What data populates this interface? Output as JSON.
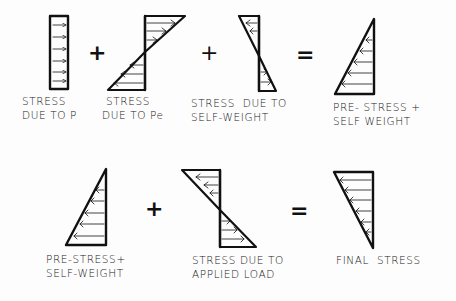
{
  "row1": {
    "items": [
      {
        "id": "p",
        "label_line1": "STRESS",
        "label_line2": "DUE TO P"
      },
      {
        "id": "pe",
        "label_line1": "STRESS",
        "label_line2": "DUE TO Pe"
      },
      {
        "id": "sw",
        "label_line1": "STRESS  DUE TO",
        "label_line2": "SELF-WEIGHT"
      },
      {
        "id": "ps_sw",
        "label_line1": "PRE- STRESS +",
        "label_line2": "SELF WEIGHT"
      }
    ],
    "operators": [
      "+",
      "+",
      "="
    ]
  },
  "row2": {
    "items": [
      {
        "id": "ps_sw2",
        "label_line1": "PRE-STRESS+",
        "label_line2": "SELF-WEIGHT"
      },
      {
        "id": "load",
        "label_line1": "STRESS DUE TO",
        "label_line2": "APPLIED LOAD"
      },
      {
        "id": "final",
        "label_line1": "FINAL  STRESS",
        "label_line2": ""
      }
    ],
    "operators": [
      "+",
      "="
    ]
  },
  "colors": {
    "ink": "#111111",
    "background": "#fdfdfd"
  }
}
